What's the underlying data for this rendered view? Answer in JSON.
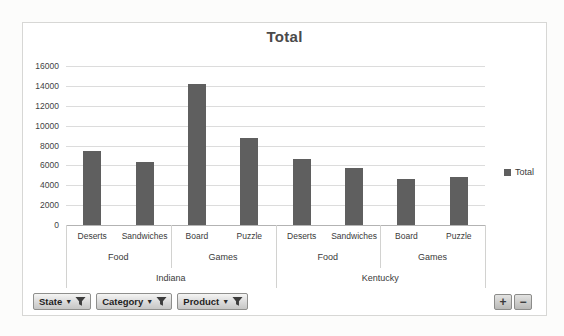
{
  "chart_data": {
    "type": "bar",
    "title": "Total",
    "categories": [
      "Deserts",
      "Sandwiches",
      "Board",
      "Puzzle",
      "Deserts",
      "Sandwiches",
      "Board",
      "Puzzle"
    ],
    "series": [
      {
        "name": "Total",
        "values": [
          7400,
          6300,
          14200,
          8800,
          6600,
          5700,
          4600,
          4800
        ]
      }
    ],
    "category_groups": [
      {
        "label": "Food",
        "span": 2
      },
      {
        "label": "Games",
        "span": 2
      },
      {
        "label": "Food",
        "span": 2
      },
      {
        "label": "Games",
        "span": 2
      }
    ],
    "state_groups": [
      {
        "label": "Indiana",
        "span": 4
      },
      {
        "label": "Kentucky",
        "span": 4
      }
    ],
    "xlabel": "",
    "ylabel": "",
    "ylim": [
      0,
      16000
    ],
    "yticks": [
      0,
      2000,
      4000,
      6000,
      8000,
      10000,
      12000,
      14000,
      16000
    ],
    "grid": true,
    "legend": [
      "Total"
    ],
    "legend_position": "right",
    "bar_color": "#5f5f5f"
  },
  "pivot_controls": {
    "field_buttons": [
      {
        "label": "State"
      },
      {
        "label": "Category"
      },
      {
        "label": "Product"
      }
    ],
    "expand_label": "+",
    "collapse_label": "−"
  }
}
